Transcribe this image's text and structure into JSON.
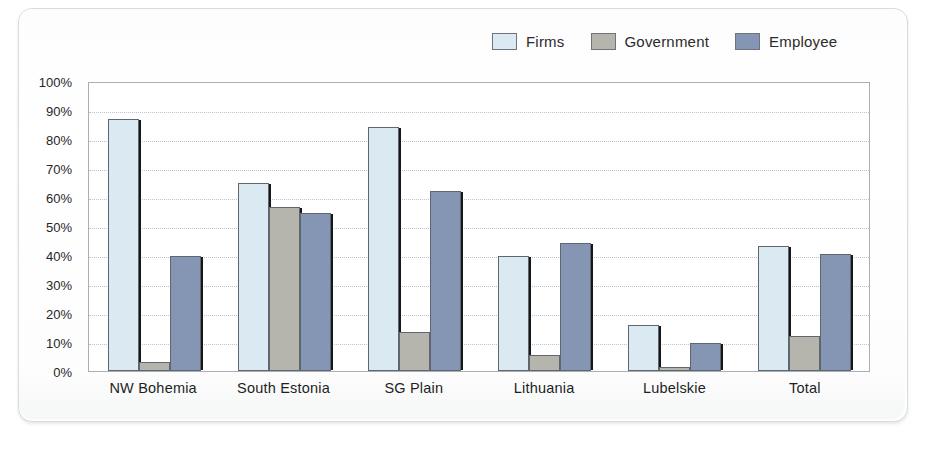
{
  "chart_data": {
    "type": "bar",
    "title": "",
    "subtitle": "",
    "xlabel": "",
    "ylabel": "",
    "ylim": [
      0,
      100
    ],
    "y_unit": "%",
    "grid": true,
    "legend_position": "top-right",
    "categories": [
      "NW Bohemia",
      "South Estonia",
      "SG Plain",
      "Lithuania",
      "Lubelskie",
      "Total"
    ],
    "y_ticks": [
      "0%",
      "10%",
      "20%",
      "30%",
      "40%",
      "50%",
      "60%",
      "70%",
      "80%",
      "90%",
      "100%"
    ],
    "y_tick_values": [
      0,
      10,
      20,
      30,
      40,
      50,
      60,
      70,
      80,
      90,
      100
    ],
    "series": [
      {
        "name": "Firms",
        "color": "#dbe9f3",
        "values": [
          87,
          65,
          84,
          39.5,
          16,
          43
        ]
      },
      {
        "name": "Government",
        "color": "#b5b5ae",
        "values": [
          3,
          56.5,
          13.5,
          5.5,
          1.5,
          12
        ]
      },
      {
        "name": "Employee",
        "color": "#8496b4",
        "values": [
          39.5,
          54.5,
          62,
          44,
          9.5,
          40.5
        ]
      }
    ]
  },
  "legend": {
    "items": [
      {
        "label": "Firms",
        "color": "#dbe9f3"
      },
      {
        "label": "Government",
        "color": "#b5b5ae"
      },
      {
        "label": "Employee",
        "color": "#8496b4"
      }
    ]
  },
  "colors": {
    "firms": "#dbe9f3",
    "government": "#b5b5ae",
    "employee": "#8496b4",
    "bar_outline": "#5f666e",
    "bar_shadow": "#15181b",
    "gridline": "#b9c4ce",
    "axis": "#a9afb6",
    "text": "#1f1f1f",
    "page": "#ffffff"
  }
}
